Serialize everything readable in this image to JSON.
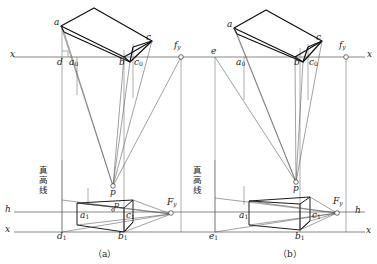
{
  "figure": {
    "title_caption_a": "（a）",
    "title_caption_b": "（b）",
    "true_height_line_label": "真高线",
    "colors": {
      "ink": "#1a1a1a",
      "thin": "#6b6b6b",
      "paper": "#ffffff"
    }
  },
  "axes": {
    "x_left_label": "x",
    "x_right_label": "x",
    "h_left_label": "h",
    "h_right_label": "h",
    "x_bottom_left_label": "x",
    "x_bottom_right_label": "x"
  },
  "panel_a": {
    "name": "(a)",
    "points": {
      "a": "a",
      "c": "c",
      "d": "d",
      "b": "b",
      "a0": "a",
      "a0_sub": "0",
      "c0": "c",
      "c0_sub": "0",
      "fy": "f",
      "fy_sub": "y",
      "p_hat": "p",
      "p": "p",
      "a1": "a",
      "a1_sub": "1",
      "c1": "c",
      "c1_sub": "1",
      "d1": "d",
      "d1_sub": "1",
      "b1": "b",
      "b1_sub": "1",
      "Fy": "F",
      "Fy_sub": "y"
    }
  },
  "panel_b": {
    "name": "(b)",
    "points": {
      "a": "a",
      "c": "c",
      "e": "e",
      "b": "b",
      "a0": "a",
      "a0_sub": "0",
      "c0": "c",
      "c0_sub": "0",
      "fy": "f",
      "fy_sub": "y",
      "p_hat": "p",
      "a1": "a",
      "a1_sub": "1",
      "c1": "c",
      "c1_sub": "1",
      "e1": "e",
      "e1_sub": "1",
      "b1": "b",
      "b1_sub": "1",
      "Fy": "F",
      "Fy_sub": "y"
    }
  }
}
